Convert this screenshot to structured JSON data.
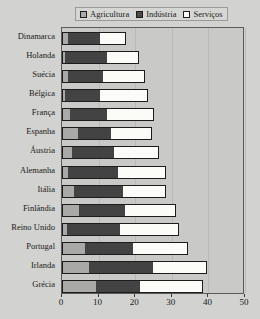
{
  "title": "",
  "legend": {
    "position": "top-center",
    "items": [
      {
        "label": "Agricultura",
        "icon": "square-swatch-icon",
        "color": "#a9a9a7"
      },
      {
        "label": "Indústria",
        "icon": "square-swatch-icon",
        "color": "#434343"
      },
      {
        "label": "Serviços",
        "icon": "square-swatch-icon",
        "color": "#fbfbf7"
      }
    ]
  },
  "chart_data": {
    "type": "bar",
    "orientation": "horizontal",
    "stacked": true,
    "title": "",
    "xlabel": "",
    "ylabel": "",
    "xlim": [
      0,
      50
    ],
    "ylim": null,
    "grid": true,
    "xticks": [
      0,
      10,
      20,
      30,
      40,
      50
    ],
    "categories": [
      "Dinamarca",
      "Holanda",
      "Suécia",
      "Bélgica",
      "França",
      "Espanha",
      "Áustria",
      "Alemanha",
      "Itália",
      "Finlândia",
      "Reino Unido",
      "Portugal",
      "Irlanda",
      "Grécia"
    ],
    "series": [
      {
        "name": "Agricultura",
        "color": "#a9a9a7",
        "values": [
          1.5,
          0.5,
          1.5,
          0.5,
          2.0,
          4.0,
          2.5,
          1.5,
          3.0,
          4.5,
          1.0,
          6.0,
          7.0,
          9.0
        ]
      },
      {
        "name": "Indústria",
        "color": "#434343",
        "values": [
          8.5,
          11.5,
          9.5,
          9.5,
          10.0,
          9.0,
          11.5,
          13.5,
          13.5,
          12.5,
          14.5,
          13.0,
          17.5,
          12.0
        ]
      },
      {
        "name": "Serviços",
        "color": "#fbfbf7",
        "values": [
          7.0,
          8.5,
          11.0,
          13.0,
          12.5,
          11.0,
          12.0,
          13.0,
          11.5,
          13.5,
          16.0,
          15.0,
          14.5,
          17.0
        ]
      }
    ],
    "totals": [
      17.0,
      20.5,
      22.0,
      23.0,
      24.5,
      24.0,
      26.0,
      28.0,
      28.0,
      30.5,
      31.5,
      34.0,
      39.0,
      38.0
    ]
  },
  "colors": {
    "page_background": "#d2d2d0",
    "plot_background": "#c9c9c7",
    "axis": "#5a5a58",
    "gridline": "#b9b9b7",
    "text": "#1a1a1a"
  }
}
